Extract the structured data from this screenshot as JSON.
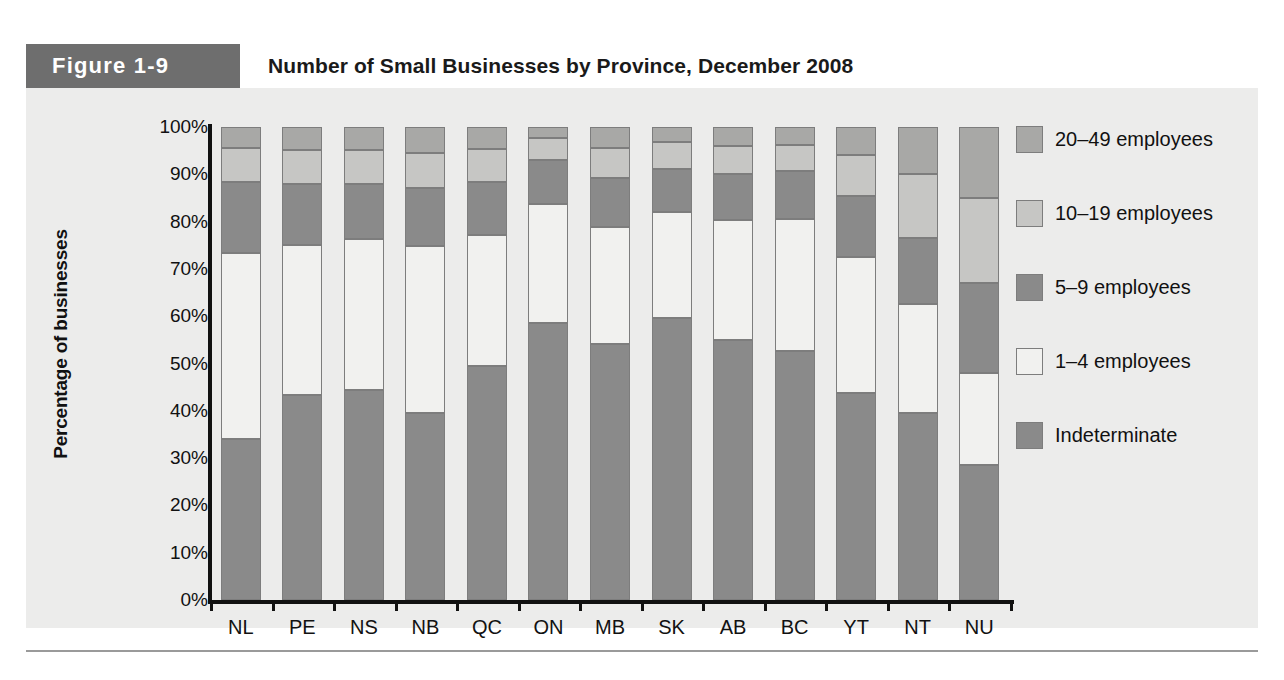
{
  "figure": {
    "tag": "Figure 1-9",
    "title": "Number of Small Businesses by Province, December 2008"
  },
  "colors": {
    "indeterminate": "#8a8a8a",
    "emp_1_4": "#f1f1ef",
    "emp_5_9": "#8a8a8a",
    "emp_10_19": "#c6c6c4",
    "emp_20_49": "#a8a8a6",
    "panel_background": "#ececeb",
    "tag_background": "#6e6e6e",
    "axis": "#111111",
    "segment_border": "#7d7d7d"
  },
  "chart_data": {
    "type": "bar",
    "subtype": "stacked-percentage",
    "title": "Number of Small Businesses by Province, December 2008",
    "xlabel": "",
    "ylabel": "Percentage of businesses",
    "ylim": [
      0,
      100
    ],
    "yticks": [
      "0%",
      "10%",
      "20%",
      "30%",
      "40%",
      "50%",
      "60%",
      "70%",
      "80%",
      "90%",
      "100%"
    ],
    "ytick_values": [
      0,
      10,
      20,
      30,
      40,
      50,
      60,
      70,
      80,
      90,
      100
    ],
    "grid": false,
    "legend_position": "right",
    "categories": [
      "NL",
      "PE",
      "NS",
      "NB",
      "QC",
      "ON",
      "MB",
      "SK",
      "AB",
      "BC",
      "YT",
      "NT",
      "NU"
    ],
    "series": [
      {
        "name": "Indeterminate",
        "color": "#8a8a8a",
        "values": [
          34.0,
          43.3,
          44.5,
          39.5,
          49.5,
          58.6,
          54.2,
          59.6,
          55.0,
          52.6,
          43.8,
          39.5,
          28.5
        ]
      },
      {
        "name": "1–4 employees",
        "color": "#f1f1ef",
        "values": [
          39.4,
          31.7,
          31.9,
          35.3,
          27.6,
          25.1,
          24.6,
          22.4,
          25.3,
          28.0,
          28.8,
          23.0,
          19.5
        ]
      },
      {
        "name": "5–9 employees",
        "color": "#8a8a8a",
        "values": [
          15.0,
          13.0,
          11.6,
          12.4,
          11.3,
          9.3,
          10.4,
          9.1,
          9.7,
          10.0,
          12.8,
          14.0,
          19.0
        ]
      },
      {
        "name": "10–19 employees",
        "color": "#c6c6c4",
        "values": [
          7.1,
          7.2,
          7.2,
          7.3,
          7.0,
          4.6,
          6.3,
          5.7,
          6.0,
          5.7,
          8.6,
          13.5,
          18.0
        ]
      },
      {
        "name": "20–49 employees",
        "color": "#a8a8a6",
        "values": [
          4.5,
          4.8,
          4.8,
          5.5,
          4.6,
          2.4,
          4.5,
          3.2,
          4.0,
          3.7,
          6.0,
          10.0,
          15.0
        ]
      }
    ],
    "cumulative_tops": {
      "NL": [
        34.0,
        73.4,
        88.4,
        95.5,
        100.0
      ],
      "PE": [
        43.3,
        75.0,
        88.0,
        95.2,
        100.0
      ],
      "NS": [
        44.5,
        76.4,
        88.0,
        95.2,
        100.0
      ],
      "NB": [
        39.5,
        74.8,
        87.2,
        94.5,
        100.0
      ],
      "QC": [
        49.5,
        77.1,
        88.4,
        95.4,
        100.0
      ],
      "ON": [
        58.6,
        83.7,
        93.0,
        97.6,
        100.0
      ],
      "MB": [
        54.2,
        78.8,
        89.2,
        95.5,
        100.0
      ],
      "SK": [
        59.6,
        82.0,
        91.1,
        96.8,
        100.0
      ],
      "AB": [
        55.0,
        80.3,
        90.0,
        96.0,
        100.0
      ],
      "BC": [
        52.6,
        80.6,
        90.6,
        96.3,
        100.0
      ],
      "YT": [
        43.8,
        72.6,
        85.4,
        94.0,
        100.0
      ],
      "NT": [
        39.5,
        62.5,
        76.5,
        90.0,
        100.0
      ],
      "NU": [
        28.5,
        48.0,
        67.0,
        85.0,
        100.0
      ]
    }
  },
  "legend": {
    "items": [
      {
        "label": "20–49 employees",
        "color": "#a8a8a6"
      },
      {
        "label": "10–19 employees",
        "color": "#c6c6c4"
      },
      {
        "label": "5–9 employees",
        "color": "#8a8a8a"
      },
      {
        "label": "1–4 employees",
        "color": "#f1f1ef"
      },
      {
        "label": "Indeterminate",
        "color": "#8a8a8a"
      }
    ]
  }
}
